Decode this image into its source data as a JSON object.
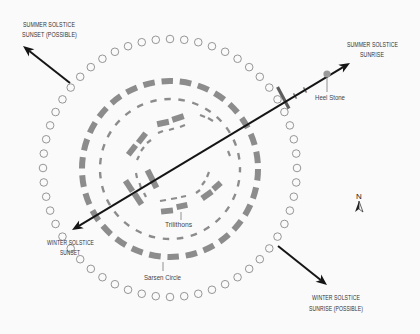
{
  "diagram": {
    "labels": {
      "summer_sunset": {
        "line1": "SUMMER SOLSTICE",
        "line2": "SUNSET (POSSIBLE)"
      },
      "summer_sunrise": {
        "line1": "SUMMER SOLSTICE",
        "line2": "SUNRISE"
      },
      "winter_sunset": {
        "line1": "WINTER SOLSTICE",
        "line2": "SUNSET"
      },
      "winter_sunrise": {
        "line1": "WINTER SOLSTICE",
        "line2": "SUNRISE (POSSIBLE)"
      },
      "heel_stone": "Heel Stone",
      "trilithons": "Trilithons",
      "sarsen_circle": "Sarsen Circle",
      "north": "N"
    },
    "aubrey_holes": {
      "count": 56
    },
    "sarsen_stones": {
      "count": 30
    },
    "colors": {
      "background": "#fafafa",
      "stone": "#8c8c8c",
      "arrow": "#151515",
      "text": "#333333"
    }
  }
}
